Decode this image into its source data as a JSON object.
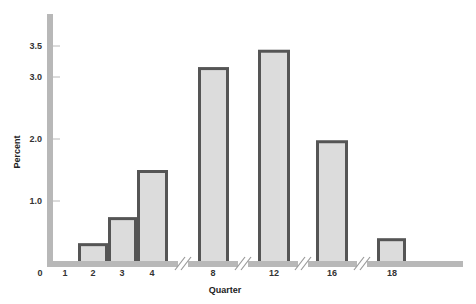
{
  "chart_data": {
    "type": "bar",
    "title": "",
    "xlabel": "Quarter",
    "ylabel": "Percent",
    "categories": [
      "2",
      "3",
      "4",
      "8",
      "12",
      "16",
      "18"
    ],
    "values": [
      0.32,
      0.74,
      1.5,
      3.16,
      3.44,
      1.98,
      0.4
    ],
    "x_tick_labels": [
      "0",
      "1",
      "2",
      "3",
      "4",
      "8",
      "12",
      "16",
      "18"
    ],
    "y_tick_labels": [
      "1.0",
      "2.0",
      "3.0",
      "3.5"
    ],
    "y_ticks": [
      1.0,
      2.0,
      3.0,
      3.5
    ],
    "ylim": [
      0,
      3.7
    ],
    "grid": false,
    "legend": null,
    "axis_breaks_between": [
      [
        "4",
        "8"
      ],
      [
        "8",
        "12"
      ],
      [
        "12",
        "16"
      ],
      [
        "16",
        "18"
      ]
    ],
    "colors": {
      "bar_fill": "#dcdcdc",
      "bar_stroke": "#555555",
      "axis": "#b8b8b8",
      "text": "#333333"
    }
  }
}
